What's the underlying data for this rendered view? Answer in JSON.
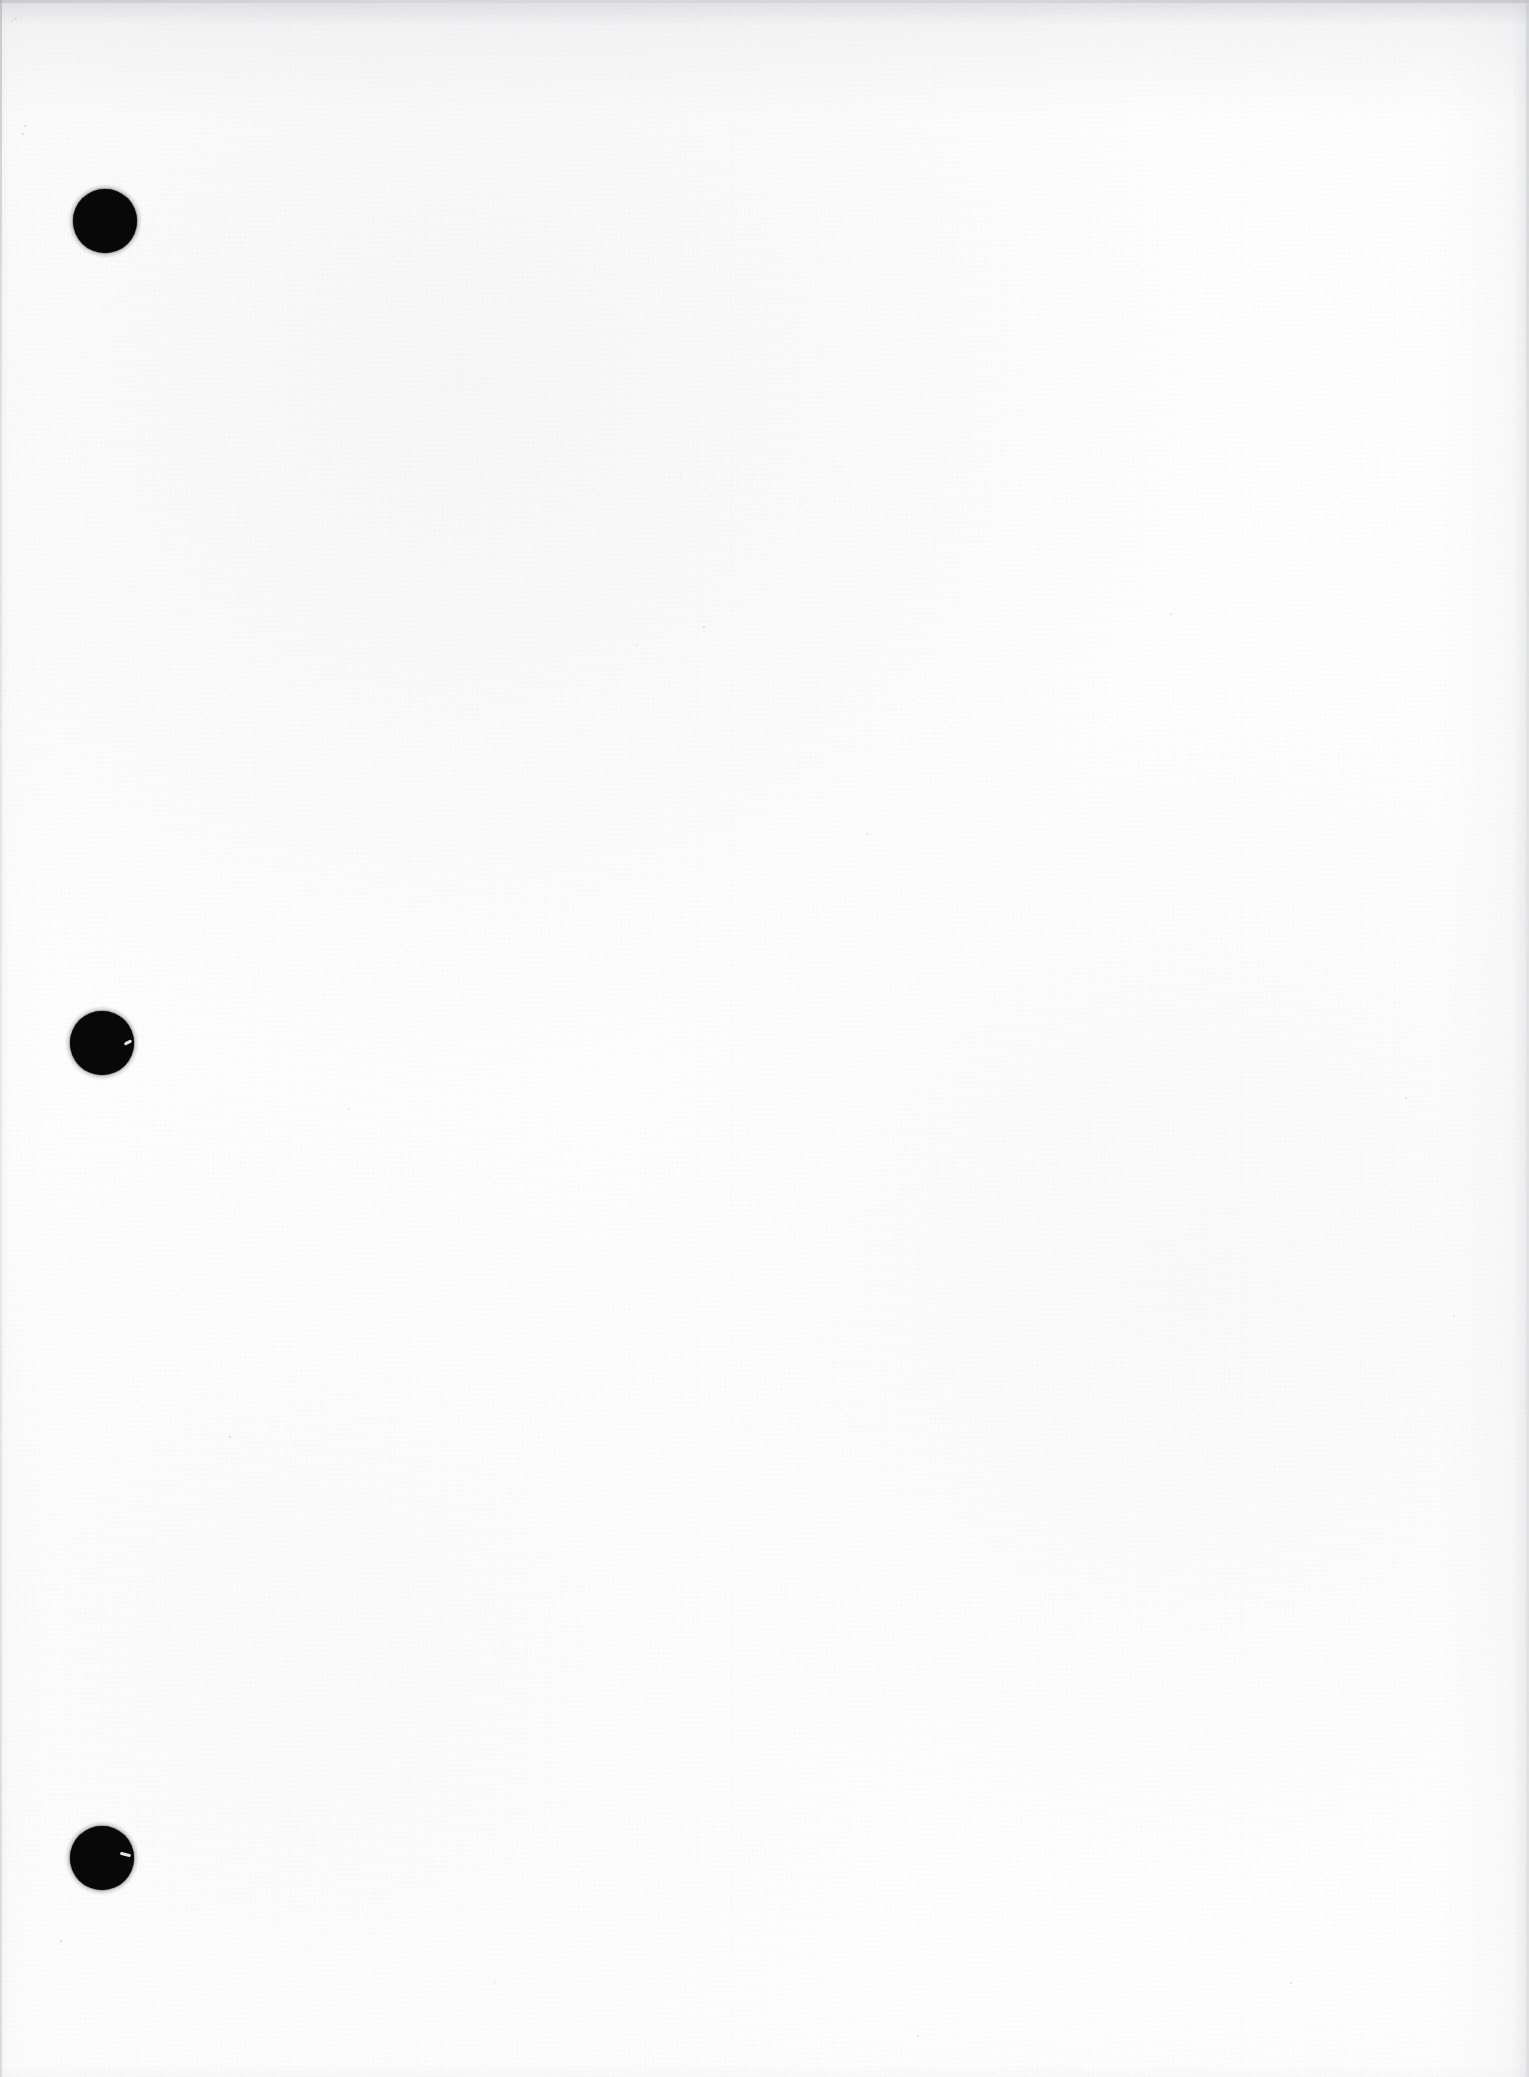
{
  "page": {
    "kind": "scanned-document-page",
    "content_state": "blank",
    "width": 1529,
    "height": 2077,
    "paper_color": "#fdfdfd",
    "ink_color": "#080808",
    "edge_shadow_color": "#c6c7ca",
    "accessible_description": "Blank scanned page with three black binder punch holes along the left margin"
  },
  "punch_holes": {
    "name": "three-ring-binder-holes",
    "count": 3,
    "color": "#080808",
    "diameter": 64,
    "items": [
      {
        "label": "punch-hole-top",
        "cx": 105,
        "cy": 221,
        "d": 64,
        "nick": null
      },
      {
        "label": "punch-hole-middle",
        "cx": 102,
        "cy": 1043,
        "d": 64,
        "nick": {
          "x": 54,
          "y": 30,
          "w": 8,
          "h": 3,
          "rot": -28
        }
      },
      {
        "label": "punch-hole-bottom",
        "cx": 102,
        "cy": 1858,
        "d": 64,
        "nick": {
          "x": 50,
          "y": 27,
          "w": 11,
          "h": 3,
          "rot": 14
        }
      }
    ]
  },
  "specks": [
    {
      "x": 14,
      "y": 17,
      "d": 3
    },
    {
      "x": 11,
      "y": 20,
      "d": 2
    },
    {
      "x": 24,
      "y": 125,
      "d": 2
    },
    {
      "x": 22,
      "y": 133,
      "d": 2
    },
    {
      "x": 703,
      "y": 626,
      "d": 2
    },
    {
      "x": 636,
      "y": 644,
      "d": 2
    },
    {
      "x": 1170,
      "y": 613,
      "d": 2
    },
    {
      "x": 866,
      "y": 833,
      "d": 2
    },
    {
      "x": 1405,
      "y": 1097,
      "d": 2
    },
    {
      "x": 229,
      "y": 1436,
      "d": 2
    },
    {
      "x": 1453,
      "y": 1315,
      "d": 2
    },
    {
      "x": 348,
      "y": 1108,
      "d": 2
    },
    {
      "x": 917,
      "y": 2035,
      "d": 2
    },
    {
      "x": 1290,
      "y": 1982,
      "d": 2
    },
    {
      "x": 60,
      "y": 1940,
      "d": 2
    },
    {
      "x": 494,
      "y": 1981,
      "d": 2
    }
  ]
}
